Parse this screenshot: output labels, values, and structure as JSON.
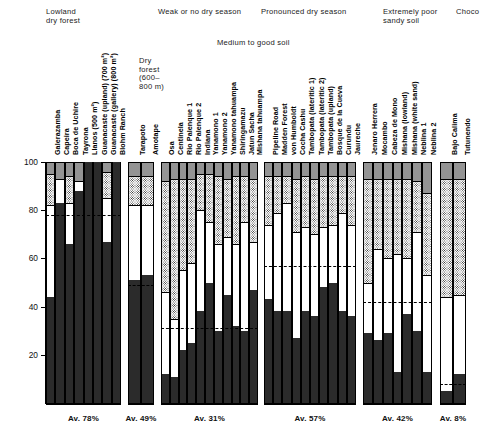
{
  "figure": {
    "y_axis_label": "% of climbing species",
    "y_ticks": [
      "100",
      "80",
      "60",
      "40",
      "20"
    ],
    "y_tick_values": [
      100,
      80,
      60,
      40,
      20
    ]
  },
  "headers": {
    "g1": "Lowland\ndry forest",
    "g2": "Dry\nforest\n(600–\n800 m)",
    "g3": "Weak or no dry season",
    "g3_soil": "Medium to good soil",
    "g4": "Pronounced dry season",
    "g5": "Extremely poor\nsandy soil",
    "g6": "Choco"
  },
  "averages": {
    "g1": "Av. 78%",
    "g2": "Av. 49%",
    "g3": "Av. 31%",
    "g4": "Av. 57%",
    "g5": "Av. 42%",
    "g6": "Av. 8%"
  },
  "chart_data": {
    "type": "bar",
    "subtype": "stacked-100-percent",
    "title": "",
    "xlabel": "",
    "ylabel": "% of climbing species",
    "ylim": [
      0,
      100
    ],
    "grid": false,
    "legend": "none",
    "segment_order_bottom_to_top": [
      "climbers",
      "white",
      "stippled",
      "grey"
    ],
    "segment_colors": {
      "climbers": "#2b2b2b",
      "white": "#ffffff",
      "stippled": "#d9d9d9",
      "grey": "#949494"
    },
    "groups": [
      {
        "name": "Lowland dry forest",
        "soil": "",
        "average": 78,
        "average_label": "Av. 78%",
        "sites": [
          {
            "label": "Galerazamba",
            "climbers": 44,
            "white": 38,
            "stippled": 13,
            "grey": 5
          },
          {
            "label": "Capeira",
            "climbers": 83,
            "white": 10,
            "stippled": 0,
            "grey": 7
          },
          {
            "label": "Boca de Uchire",
            "climbers": 66,
            "white": 17,
            "stippled": 11,
            "grey": 6
          },
          {
            "label": "Tayrona",
            "climbers": 88,
            "white": 4,
            "stippled": 0,
            "grey": 8
          },
          {
            "label": "Llanos (500 m²)",
            "climbers": 100,
            "white": 0,
            "stippled": 0,
            "grey": 0
          },
          {
            "label": "Guanacaste (upland) (700 m²)",
            "climbers": 100,
            "white": 0,
            "stippled": 0,
            "grey": 0
          },
          {
            "label": "Guanacaste (gallery) (800 m²)",
            "climbers": 67,
            "white": 18,
            "stippled": 11,
            "grey": 4
          },
          {
            "label": "Blohm Ranch",
            "climbers": 100,
            "white": 0,
            "stippled": 0,
            "grey": 0
          }
        ]
      },
      {
        "name": "Dry forest (600–800 m)",
        "soil": "",
        "average": 49,
        "average_label": "Av. 49%",
        "sites": [
          {
            "label": "Tarapoto",
            "climbers": 51,
            "white": 31,
            "stippled": 12,
            "grey": 6
          },
          {
            "label": "Amotape",
            "climbers": 53,
            "white": 29,
            "stippled": 12,
            "grey": 6
          }
        ]
      },
      {
        "name": "Weak or no dry season",
        "soil": "Medium to good soil",
        "average": 31,
        "average_label": "Av. 31%",
        "sites": [
          {
            "label": "Osa",
            "climbers": 12,
            "white": 34,
            "stippled": 46,
            "grey": 8
          },
          {
            "label": "Centinela",
            "climbers": 11,
            "white": 24,
            "stippled": 58,
            "grey": 7
          },
          {
            "label": "Rio Palenque 1",
            "climbers": 22,
            "white": 33,
            "stippled": 38,
            "grey": 7
          },
          {
            "label": "Rio Palenque 2",
            "climbers": 25,
            "white": 33,
            "stippled": 35,
            "grey": 7
          },
          {
            "label": "Indiana",
            "climbers": 38,
            "white": 42,
            "stippled": 15,
            "grey": 5
          },
          {
            "label": "Yanamono 1",
            "climbers": 50,
            "white": 25,
            "stippled": 20,
            "grey": 5
          },
          {
            "label": "Yanamono 2",
            "climbers": 30,
            "white": 36,
            "stippled": 28,
            "grey": 6
          },
          {
            "label": "Yanamono tahuampa",
            "climbers": 45,
            "white": 24,
            "stippled": 24,
            "grey": 7
          },
          {
            "label": "Shiringamazu",
            "climbers": 32,
            "white": 34,
            "stippled": 28,
            "grey": 6
          },
          {
            "label": "Jatun Sacha",
            "climbers": 30,
            "white": 45,
            "stippled": 19,
            "grey": 6
          },
          {
            "label": "Mishana tahuampa",
            "climbers": 47,
            "white": 20,
            "stippled": 26,
            "grey": 7
          }
        ]
      },
      {
        "name": "Pronounced dry season",
        "soil": "Medium to good soil",
        "average": 57,
        "average_label": "Av. 57%",
        "sites": [
          {
            "label": "Pipeline Road",
            "climbers": 43,
            "white": 31,
            "stippled": 20,
            "grey": 6
          },
          {
            "label": "Madden Forest",
            "climbers": 38,
            "white": 41,
            "stippled": 15,
            "grey": 6
          },
          {
            "label": "von Humboldt",
            "climbers": 38,
            "white": 45,
            "stippled": 11,
            "grey": 6
          },
          {
            "label": "Cocha Cashu",
            "climbers": 27,
            "white": 44,
            "stippled": 22,
            "grey": 7
          },
          {
            "label": "Tambopata (lateritic 1)",
            "climbers": 38,
            "white": 35,
            "stippled": 21,
            "grey": 6
          },
          {
            "label": "Tambopata (lateritic 2)",
            "climbers": 36,
            "white": 34,
            "stippled": 23,
            "grey": 7
          },
          {
            "label": "Tambopata (upland)",
            "climbers": 48,
            "white": 25,
            "stippled": 21,
            "grey": 6
          },
          {
            "label": "Bosque de la Cueva",
            "climbers": 50,
            "white": 24,
            "stippled": 20,
            "grey": 6
          },
          {
            "label": "Curundu",
            "climbers": 38,
            "white": 41,
            "stippled": 15,
            "grey": 6
          },
          {
            "label": "Jaureche",
            "climbers": 36,
            "white": 38,
            "stippled": 20,
            "grey": 6
          }
        ]
      },
      {
        "name": "Extremely poor sandy soil",
        "soil": "",
        "average": 42,
        "average_label": "Av. 42%",
        "sites": [
          {
            "label": "Jenaro Herrera",
            "climbers": 29,
            "white": 21,
            "stippled": 43,
            "grey": 7
          },
          {
            "label": "Mocambo",
            "climbers": 26,
            "white": 38,
            "stippled": 29,
            "grey": 7
          },
          {
            "label": "Cabeza de Mono",
            "climbers": 29,
            "white": 31,
            "stippled": 33,
            "grey": 7
          },
          {
            "label": "Mishana (lowland)",
            "climbers": 13,
            "white": 49,
            "stippled": 31,
            "grey": 7
          },
          {
            "label": "Mishana (white sand)",
            "climbers": 37,
            "white": 23,
            "stippled": 33,
            "grey": 7
          },
          {
            "label": "Neblina 1",
            "climbers": 30,
            "white": 41,
            "stippled": 21,
            "grey": 8
          },
          {
            "label": "Neblina 2",
            "climbers": 13,
            "white": 40,
            "stippled": 34,
            "grey": 13
          }
        ]
      },
      {
        "name": "Choco",
        "soil": "",
        "average": 8,
        "average_label": "Av. 8%",
        "sites": [
          {
            "label": "Bajo Calima",
            "climbers": 5,
            "white": 39,
            "stippled": 49,
            "grey": 7
          },
          {
            "label": "Tutunendo",
            "climbers": 12,
            "white": 33,
            "stippled": 48,
            "grey": 7
          }
        ]
      }
    ]
  }
}
